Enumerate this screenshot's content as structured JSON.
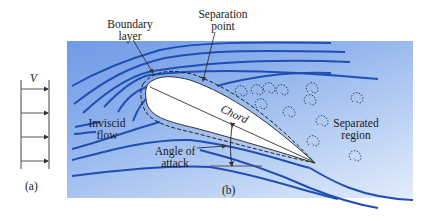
{
  "figure": {
    "panel_a": {
      "velocity_symbol": "V",
      "caption": "(a)"
    },
    "panel_b": {
      "caption": "(b)",
      "labels": {
        "boundary_layer": [
          "Boundary",
          "layer"
        ],
        "separation_point": [
          "Separation",
          "point"
        ],
        "inviscid_flow": [
          "Inviscid",
          "flow"
        ],
        "chord": "Chord",
        "angle_of_attack": [
          "Angle of",
          "attack"
        ],
        "separated_region": [
          "Separated",
          "region"
        ]
      }
    },
    "colors": {
      "streamline": "#1f4fb5",
      "background_top": "#6f9ae6",
      "background_bottom": "#e3edfb",
      "airfoil_fill": "#ffffff",
      "outline": "#333333"
    }
  }
}
